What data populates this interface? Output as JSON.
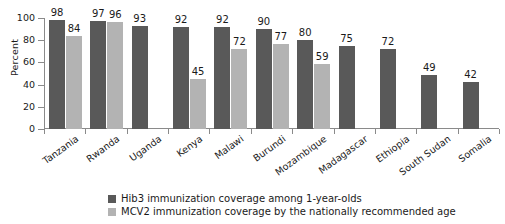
{
  "chart_data": {
    "type": "bar",
    "title": "",
    "xlabel": "",
    "ylabel": "Percent",
    "ylim": [
      0,
      100
    ],
    "yticks": [
      0,
      20,
      40,
      60,
      80,
      100
    ],
    "grid": false,
    "legend_position": "bottom-left",
    "categories": [
      "Tanzania",
      "Rwanda",
      "Uganda",
      "Kenya",
      "Malawi",
      "Burundi",
      "Mozambique",
      "Madagascar",
      "Ethiopia",
      "South Sudan",
      "Somalia"
    ],
    "series": [
      {
        "name": "Hib3 immunization coverage among 1-year-olds",
        "color": "#595959",
        "values": [
          98,
          97,
          93,
          92,
          92,
          90,
          80,
          75,
          72,
          49,
          42
        ]
      },
      {
        "name": "MCV2 immunization coverage by the nationally recommended age",
        "color": "#b3b3b3",
        "values": [
          84,
          96,
          null,
          45,
          72,
          77,
          59,
          null,
          null,
          null,
          null
        ]
      }
    ]
  },
  "axis": {
    "y_title": "Percent",
    "y_tick_labels": [
      "100",
      "80",
      "60",
      "40",
      "20",
      "0"
    ]
  },
  "legend": {
    "items": [
      {
        "label": "Hib3 immunization coverage among 1-year-olds",
        "color": "#595959"
      },
      {
        "label": "MCV2 immunization coverage by the nationally recommended age",
        "color": "#b3b3b3"
      }
    ]
  }
}
